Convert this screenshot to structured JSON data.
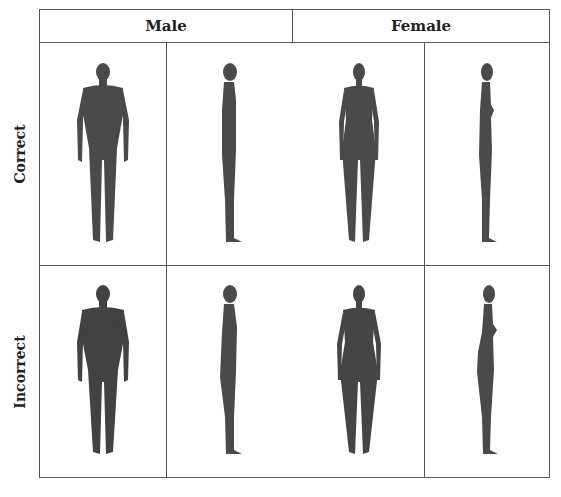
{
  "table": {
    "column_headers": [
      "Male",
      "Female"
    ],
    "row_headers": [
      "Correct",
      "Incorrect"
    ],
    "views": [
      "front",
      "side"
    ],
    "cells": [
      {
        "row": "Correct",
        "sex": "Male",
        "view": "front",
        "figure": "male-front-figure"
      },
      {
        "row": "Correct",
        "sex": "Male",
        "view": "side",
        "figure": "male-side-figure"
      },
      {
        "row": "Correct",
        "sex": "Female",
        "view": "front",
        "figure": "female-front-figure"
      },
      {
        "row": "Correct",
        "sex": "Female",
        "view": "side",
        "figure": "female-side-figure"
      },
      {
        "row": "Incorrect",
        "sex": "Male",
        "view": "front",
        "figure": "male-front-figure"
      },
      {
        "row": "Incorrect",
        "sex": "Male",
        "view": "side",
        "figure": "male-side-figure"
      },
      {
        "row": "Incorrect",
        "sex": "Female",
        "view": "front",
        "figure": "female-front-figure"
      },
      {
        "row": "Incorrect",
        "sex": "Female",
        "view": "side",
        "figure": "female-side-figure"
      }
    ]
  },
  "colors": {
    "line": "#555555",
    "figure": "#4a4a4a",
    "text": "#222222"
  }
}
